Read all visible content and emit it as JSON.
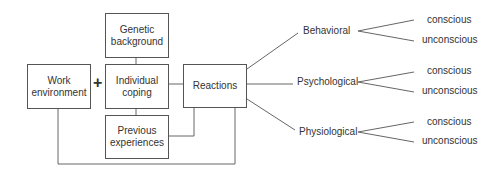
{
  "boxes": {
    "genetic": "Genetic\nbackground",
    "work": "Work\nenvironment",
    "coping": "Individual\ncoping",
    "reactions": "Reactions",
    "previous": "Previous\nexperiences"
  },
  "plus_sign": "+",
  "branches": [
    {
      "label": "Behavioral",
      "children": [
        "conscious",
        "unconscious"
      ]
    },
    {
      "label": "Psychological",
      "children": [
        "conscious",
        "unconscious"
      ]
    },
    {
      "label": "Physiological",
      "children": [
        "conscious",
        "unconscious"
      ]
    }
  ]
}
